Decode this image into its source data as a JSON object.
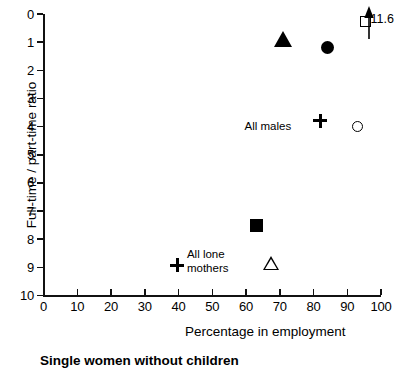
{
  "chart_data": {
    "type": "scatter",
    "title": "",
    "caption": "Single women without children",
    "xlabel": "Percentage in employment",
    "ylabel": "Full-time / part-time ratio",
    "xlim": [
      0,
      100
    ],
    "ylim": [
      0,
      10
    ],
    "xticks": [
      0,
      10,
      20,
      30,
      40,
      50,
      60,
      70,
      80,
      90,
      100
    ],
    "yticks": [
      0,
      1,
      2,
      3,
      4,
      5,
      6,
      7,
      8,
      9,
      10
    ],
    "grid": false,
    "legend": "none",
    "points": [
      {
        "id": "filled-triangle",
        "marker": "filled-triangle",
        "x": 71.0,
        "y": 9.1,
        "label": "",
        "value_label": ""
      },
      {
        "id": "filled-circle",
        "marker": "filled-circle",
        "x": 84.0,
        "y": 8.8,
        "label": "",
        "value_label": ""
      },
      {
        "id": "open-square",
        "marker": "open-square",
        "x": 95.5,
        "y": 9.75,
        "label": "",
        "value_label": "11.6"
      },
      {
        "id": "all-males-plus",
        "marker": "plus",
        "x": 82.0,
        "y": 6.2,
        "label": "All males",
        "value_label": ""
      },
      {
        "id": "open-circle",
        "marker": "open-circle",
        "x": 93.0,
        "y": 6.0,
        "label": "",
        "value_label": ""
      },
      {
        "id": "filled-square",
        "marker": "filled-square",
        "x": 63.0,
        "y": 2.5,
        "label": "",
        "value_label": ""
      },
      {
        "id": "all-lone-mothers-plus",
        "marker": "plus",
        "x": 39.7,
        "y": 1.07,
        "label": "All lone mothers",
        "value_label": ""
      },
      {
        "id": "open-triangle",
        "marker": "open-triangle",
        "x": 67.5,
        "y": 1.15,
        "label": "",
        "value_label": ""
      }
    ],
    "annotations": [
      {
        "id": "all-males",
        "text": "All males",
        "x": 73.5,
        "y": 6.0
      },
      {
        "id": "all-lone-mothers-line1",
        "text": "All lone",
        "x": 42.5,
        "y": 1.45
      },
      {
        "id": "all-lone-mothers-line2",
        "text": "mothers",
        "x": 42.5,
        "y": 0.95
      },
      {
        "id": "off-scale-value",
        "text": "11.6",
        "x": 97.5,
        "y": 9.75
      }
    ],
    "off_scale_indicator": {
      "id": "up-arrow",
      "description": "upward arrow indicating value above axis maximum",
      "x": 96.5,
      "value": 11.6
    }
  },
  "axes": {
    "y_tick_labels": [
      "10",
      "9",
      "8",
      "7",
      "6",
      "5",
      "4",
      "3",
      "2",
      "1",
      "0"
    ],
    "x_tick_labels": [
      "0",
      "10",
      "20",
      "30",
      "40",
      "50",
      "60",
      "70",
      "80",
      "90",
      "100"
    ],
    "y_title": "Full-time / part-time ratio",
    "x_title": "Percentage in employment"
  },
  "caption": {
    "text": "Single women without children"
  },
  "colors": {
    "ink": "#000000",
    "background": "#ffffff"
  }
}
